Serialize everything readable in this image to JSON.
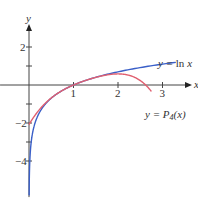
{
  "chart_data": {
    "type": "line",
    "title": "",
    "xlabel": "x",
    "ylabel": "y",
    "xlim": [
      -0.65,
      3.5
    ],
    "ylim": [
      -5.9,
      3.3
    ],
    "x_ticks": [
      1,
      2,
      3
    ],
    "x_tick_labels": [
      "1",
      "2",
      "3"
    ],
    "y_ticks": [
      -4,
      -3,
      -2,
      -1,
      1,
      2
    ],
    "y_tick_labels": [
      "-4",
      "-2",
      "2"
    ],
    "grid": false,
    "series": [
      {
        "name": "y = ln x",
        "label_parts": {
          "prefix": "y = ",
          "fn": "ln",
          "var": "x"
        },
        "color": "#3a5fc8",
        "function": "ln(x)",
        "domain": [
          0.003,
          3.3
        ]
      },
      {
        "name": "y = P4(x)",
        "label_parts": {
          "prefix": "y = ",
          "fn": "P",
          "sub": "4",
          "var": "(x)"
        },
        "color": "#e06070",
        "function": "(x-1) - (x-1)^2/2 + (x-1)^3/3 - (x-1)^4/4",
        "domain": [
          0,
          2.75
        ]
      }
    ]
  }
}
